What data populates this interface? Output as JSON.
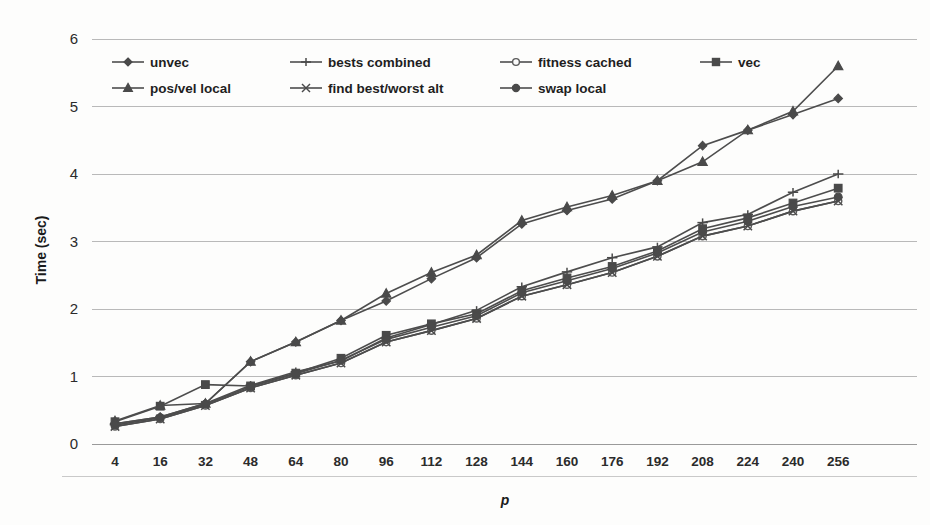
{
  "chart_data": {
    "type": "line",
    "title": "",
    "xlabel": "p",
    "ylabel": "Time (sec)",
    "ylim": [
      0,
      6
    ],
    "yticks": [
      0,
      1,
      2,
      3,
      4,
      5,
      6
    ],
    "grid": true,
    "legend_position": "top-inside",
    "categories": [
      4,
      16,
      32,
      48,
      64,
      80,
      96,
      112,
      128,
      144,
      160,
      176,
      192,
      208,
      224,
      240,
      256
    ],
    "series": [
      {
        "name": "unvec",
        "marker": "diamond",
        "values": [
          0.33,
          0.56,
          0.88,
          0.86,
          1.05,
          1.27,
          1.61,
          1.78,
          1.93,
          2.27,
          2.46,
          2.63,
          2.86,
          3.19,
          3.35,
          3.57,
          3.76
        ]
      },
      {
        "name": "bests combined",
        "marker": "plus",
        "values": [
          0.3,
          0.4,
          0.6,
          0.87,
          1.07,
          1.23,
          1.57,
          1.77,
          1.98,
          2.33,
          2.55,
          2.76,
          2.92,
          3.28,
          3.4,
          3.73,
          4.0
        ]
      },
      {
        "name": "fitness cached",
        "marker": "circle-open",
        "values": [
          0.26,
          0.37,
          0.57,
          0.83,
          1.02,
          1.2,
          1.51,
          1.68,
          1.86,
          2.19,
          2.36,
          2.54,
          2.78,
          3.08,
          3.23,
          3.45,
          3.6
        ]
      },
      {
        "name": "vec",
        "marker": "square",
        "values": [
          0.33,
          0.56,
          0.88,
          0.86,
          1.05,
          1.27,
          1.61,
          1.78,
          1.93,
          2.27,
          2.46,
          2.63,
          2.86,
          3.19,
          3.35,
          3.57,
          3.79
        ]
      },
      {
        "name": "pos/vel local",
        "marker": "triangle",
        "values": [
          0.34,
          0.57,
          0.6,
          1.22,
          1.51,
          1.83,
          2.23,
          2.54,
          2.8,
          3.31,
          3.51,
          3.68,
          3.9,
          4.18,
          4.65,
          4.93,
          5.6
        ]
      },
      {
        "name": "find best/worst alt",
        "marker": "x",
        "values": [
          0.26,
          0.37,
          0.57,
          0.83,
          1.02,
          1.2,
          1.51,
          1.68,
          1.86,
          2.19,
          2.36,
          2.54,
          2.78,
          3.08,
          3.23,
          3.45,
          3.6
        ]
      },
      {
        "name": "swap local",
        "marker": "circle",
        "values": [
          0.28,
          0.39,
          0.59,
          0.85,
          1.04,
          1.24,
          1.55,
          1.73,
          1.9,
          2.24,
          2.42,
          2.6,
          2.83,
          3.14,
          3.3,
          3.52,
          3.66
        ]
      }
    ],
    "upper_group": [
      {
        "name": "pos/vel local-upper",
        "marker": "triangle",
        "values": [
          0.34,
          0.57,
          0.6,
          1.22,
          1.51,
          1.83,
          2.23,
          2.54,
          2.8,
          3.31,
          3.51,
          3.68,
          3.9,
          4.18,
          4.65,
          4.93,
          5.6
        ]
      },
      {
        "name": "unvec-upper",
        "marker": "diamond",
        "values": [
          0.3,
          0.4,
          0.6,
          1.22,
          1.51,
          1.83,
          2.12,
          2.45,
          2.76,
          3.26,
          3.46,
          3.63,
          3.9,
          4.42,
          4.65,
          4.88,
          5.12
        ]
      }
    ]
  },
  "legend": {
    "row1": [
      {
        "label": "unvec",
        "marker": "diamond"
      },
      {
        "label": "bests combined",
        "marker": "plus"
      },
      {
        "label": "fitness cached",
        "marker": "circle-open"
      },
      {
        "label": "vec",
        "marker": "square"
      }
    ],
    "row2": [
      {
        "label": "pos/vel local",
        "marker": "triangle"
      },
      {
        "label": "find best/worst alt",
        "marker": "x"
      },
      {
        "label": "swap local",
        "marker": "circle"
      }
    ]
  },
  "colors": {
    "line": "#4d4d4d",
    "marker": "#4a4a4a",
    "grid": "#b9b9b9",
    "text": "#1f1f1f",
    "background": "#fdfdfc"
  },
  "bleed_text": {
    "t1": "tain the",
    "t2": "fitness",
    "t3": "of each",
    "t4": "particle",
    "t5": "and",
    "t6": "the",
    "t7": "best",
    "t8": "known",
    "t9": "position",
    "t10": "in the",
    "t11": "swarm"
  }
}
